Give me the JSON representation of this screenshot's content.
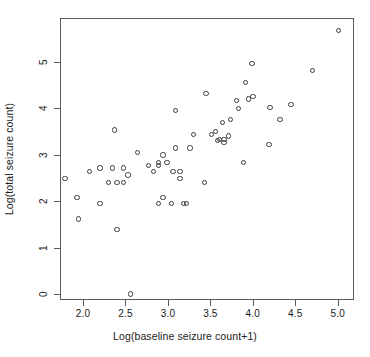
{
  "chart_data": {
    "type": "scatter",
    "title": "",
    "xlabel": "Log(baseline seizure count+1)",
    "ylabel": "Log(total seizure count)",
    "xlim": [
      1.73,
      5.19
    ],
    "ylim": [
      -0.13,
      5.94
    ],
    "xticks": [
      2.0,
      2.5,
      3.0,
      3.5,
      4.0,
      4.5,
      5.0
    ],
    "xticklabels": [
      "2.0",
      "2.5",
      "3.0",
      "3.5",
      "4.0",
      "4.5",
      "5.0"
    ],
    "yticks": [
      0,
      1,
      2,
      3,
      4,
      5
    ],
    "yticklabels": [
      "0",
      "1",
      "2",
      "3",
      "4",
      "5"
    ],
    "grid": false,
    "legend": null,
    "marker": "open-circle",
    "marker_color": "#3b3b3b",
    "frame_color": "#5a5a5a",
    "n_points": 59,
    "points": [
      {
        "x": 1.79,
        "y": 2.48
      },
      {
        "x": 1.93,
        "y": 2.08
      },
      {
        "x": 1.95,
        "y": 1.61
      },
      {
        "x": 2.08,
        "y": 2.64
      },
      {
        "x": 2.2,
        "y": 1.95
      },
      {
        "x": 2.2,
        "y": 2.71
      },
      {
        "x": 2.3,
        "y": 2.4
      },
      {
        "x": 2.35,
        "y": 2.71
      },
      {
        "x": 2.37,
        "y": 3.53
      },
      {
        "x": 2.4,
        "y": 1.39
      },
      {
        "x": 2.4,
        "y": 2.4
      },
      {
        "x": 2.48,
        "y": 2.4
      },
      {
        "x": 2.48,
        "y": 2.71
      },
      {
        "x": 2.53,
        "y": 2.56
      },
      {
        "x": 2.56,
        "y": 0.0
      },
      {
        "x": 2.64,
        "y": 3.04
      },
      {
        "x": 2.77,
        "y": 2.77
      },
      {
        "x": 2.83,
        "y": 2.64
      },
      {
        "x": 2.89,
        "y": 2.83
      },
      {
        "x": 2.89,
        "y": 2.77
      },
      {
        "x": 2.89,
        "y": 1.95
      },
      {
        "x": 2.94,
        "y": 2.08
      },
      {
        "x": 2.94,
        "y": 2.99
      },
      {
        "x": 2.99,
        "y": 2.83
      },
      {
        "x": 3.04,
        "y": 1.95
      },
      {
        "x": 3.06,
        "y": 2.64
      },
      {
        "x": 3.09,
        "y": 3.95
      },
      {
        "x": 3.09,
        "y": 3.14
      },
      {
        "x": 3.14,
        "y": 2.64
      },
      {
        "x": 3.14,
        "y": 2.48
      },
      {
        "x": 3.18,
        "y": 1.95
      },
      {
        "x": 3.22,
        "y": 1.95
      },
      {
        "x": 3.26,
        "y": 3.14
      },
      {
        "x": 3.3,
        "y": 3.43
      },
      {
        "x": 3.43,
        "y": 2.4
      },
      {
        "x": 3.45,
        "y": 4.31
      },
      {
        "x": 3.51,
        "y": 3.43
      },
      {
        "x": 3.56,
        "y": 3.5
      },
      {
        "x": 3.58,
        "y": 3.3
      },
      {
        "x": 3.61,
        "y": 3.33
      },
      {
        "x": 3.64,
        "y": 3.69
      },
      {
        "x": 3.66,
        "y": 3.33
      },
      {
        "x": 3.66,
        "y": 3.26
      },
      {
        "x": 3.71,
        "y": 3.4
      },
      {
        "x": 3.74,
        "y": 3.76
      },
      {
        "x": 3.81,
        "y": 4.17
      },
      {
        "x": 3.83,
        "y": 3.99
      },
      {
        "x": 3.89,
        "y": 2.83
      },
      {
        "x": 3.91,
        "y": 4.55
      },
      {
        "x": 3.95,
        "y": 4.2
      },
      {
        "x": 3.99,
        "y": 4.96
      },
      {
        "x": 4.0,
        "y": 4.25
      },
      {
        "x": 4.19,
        "y": 3.22
      },
      {
        "x": 4.2,
        "y": 4.02
      },
      {
        "x": 4.32,
        "y": 3.76
      },
      {
        "x": 4.45,
        "y": 4.08
      },
      {
        "x": 4.7,
        "y": 4.81
      },
      {
        "x": 5.01,
        "y": 5.67
      }
    ]
  }
}
